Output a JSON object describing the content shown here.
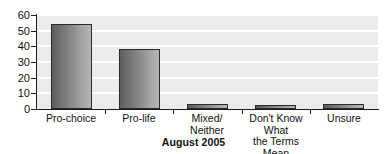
{
  "chart_data": {
    "type": "bar",
    "title": "August 2005",
    "xlabel": "",
    "ylabel": "",
    "ylim": [
      0,
      60
    ],
    "ytick_step": 10,
    "yticks": [
      "60",
      "50",
      "40",
      "30",
      "20",
      "10",
      "0"
    ],
    "grid": "horizontal",
    "legend": "none",
    "categories": [
      "Pro-choice",
      "Pro-life",
      "Mixed/\nNeither",
      "Don't Know What\nthe Terms Mean",
      "Unsure"
    ],
    "category_lines": [
      [
        "Pro-choice"
      ],
      [
        "Pro-life"
      ],
      [
        "Mixed/",
        "Neither"
      ],
      [
        "Don't Know What",
        "the Terms Mean"
      ],
      [
        "Unsure"
      ]
    ],
    "values": [
      54,
      38,
      3,
      2,
      3
    ],
    "colors": {
      "plot_background": "#ebebeb",
      "gridline": "#ffffff",
      "bar_gradient_start": "#5e5e5e",
      "bar_gradient_end": "#b4b4b4",
      "bar_outline": "#2b2b2b",
      "axis": "#1a1a1a",
      "text": "#111111"
    }
  },
  "partial_top_text": ""
}
